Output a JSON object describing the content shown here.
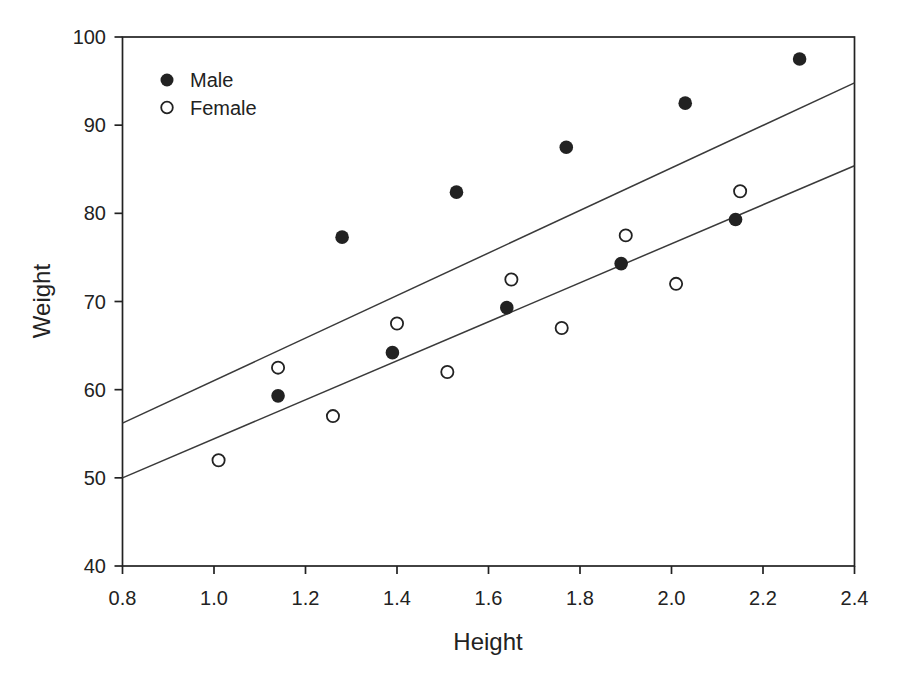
{
  "chart_data": {
    "type": "scatter",
    "title": "",
    "xlabel": "Height",
    "ylabel": "Weight",
    "xlim": [
      0.8,
      2.4
    ],
    "ylim": [
      40,
      100
    ],
    "x_ticks": [
      0.8,
      1.0,
      1.2,
      1.4,
      1.6,
      1.8,
      2.0,
      2.2,
      2.4
    ],
    "x_tick_labels": [
      "0.8",
      "1.0",
      "1.2",
      "1.4",
      "1.6",
      "1.8",
      "2.0",
      "2.2",
      "2.4"
    ],
    "y_ticks": [
      40,
      50,
      60,
      70,
      80,
      90,
      100
    ],
    "y_tick_labels": [
      "40",
      "50",
      "60",
      "70",
      "80",
      "90",
      "100"
    ],
    "grid": false,
    "legend": {
      "position": "top-left-inside",
      "entries": [
        "Male",
        "Female"
      ]
    },
    "series": [
      {
        "name": "Male",
        "marker": "filled-circle",
        "color": "#222222",
        "points": [
          [
            1.14,
            59.3
          ],
          [
            1.28,
            77.3
          ],
          [
            1.39,
            64.2
          ],
          [
            1.53,
            82.4
          ],
          [
            1.64,
            69.3
          ],
          [
            1.77,
            87.5
          ],
          [
            1.89,
            74.3
          ],
          [
            2.03,
            92.5
          ],
          [
            2.14,
            79.3
          ],
          [
            2.28,
            97.5
          ]
        ]
      },
      {
        "name": "Female",
        "marker": "open-circle",
        "color": "#222222",
        "points": [
          [
            1.01,
            52.0
          ],
          [
            1.14,
            62.5
          ],
          [
            1.26,
            57.0
          ],
          [
            1.4,
            67.5
          ],
          [
            1.51,
            62.0
          ],
          [
            1.65,
            72.5
          ],
          [
            1.76,
            67.0
          ],
          [
            1.9,
            77.5
          ],
          [
            2.01,
            72.0
          ],
          [
            2.15,
            82.5
          ]
        ]
      }
    ],
    "fit_lines": [
      {
        "name": "male-fit-line",
        "series": "Male",
        "x1": 0.8,
        "y1": 56.2,
        "x2": 2.4,
        "y2": 94.8
      },
      {
        "name": "female-fit-line",
        "series": "Female",
        "x1": 0.8,
        "y1": 50.0,
        "x2": 2.4,
        "y2": 85.4
      }
    ]
  },
  "colors": {
    "ink": "#222222",
    "line_ink": "#3a3a3a",
    "background": "#ffffff"
  }
}
